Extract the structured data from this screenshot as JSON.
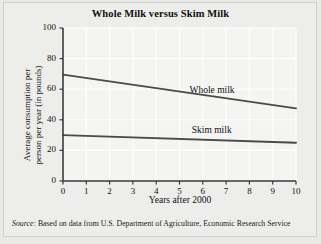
{
  "figure": {
    "title": "Whole Milk versus Skim Milk",
    "source_label": "Source:",
    "source_text": " Based on data from U.S. Department of Agriculture, Economic Research Service",
    "background_color": "#e9e9e7",
    "plot_background_color": "#f4f4f2",
    "gridline_color": "#ffffff",
    "axis_color": "#3a3a3a",
    "line_color": "#4a4a4a"
  },
  "chart_data": {
    "type": "line",
    "title": "Whole Milk versus Skim Milk",
    "xlabel": "Years after 2000",
    "ylabel": "Average consumption per person per year (in pounds)",
    "ylabel_line1": "Average consumption per",
    "ylabel_line2": "person per year (in pounds)",
    "xlim": [
      0,
      10
    ],
    "ylim": [
      0,
      100
    ],
    "xticks": [
      0,
      1,
      2,
      3,
      4,
      5,
      6,
      7,
      8,
      9,
      10
    ],
    "yticks": [
      0,
      20,
      40,
      60,
      80,
      100
    ],
    "xtick_labels": [
      "0",
      "1",
      "2",
      "3",
      "4",
      "5",
      "6",
      "7",
      "8",
      "9",
      "10"
    ],
    "ytick_labels": [
      "0",
      "20",
      "40",
      "60",
      "80",
      "100"
    ],
    "grid": true,
    "grid_axis": "both",
    "legend_position": "inline-annotation",
    "x": [
      0,
      10
    ],
    "series": [
      {
        "name": "Whole milk",
        "label": "Whole milk",
        "values": [
          69.5,
          47.5
        ],
        "annotation_x": 6.2,
        "annotation_y": 59
      },
      {
        "name": "Skim milk",
        "label": "Skim milk",
        "values": [
          30,
          25
        ],
        "annotation_x": 6.3,
        "annotation_y": 33
      }
    ]
  }
}
